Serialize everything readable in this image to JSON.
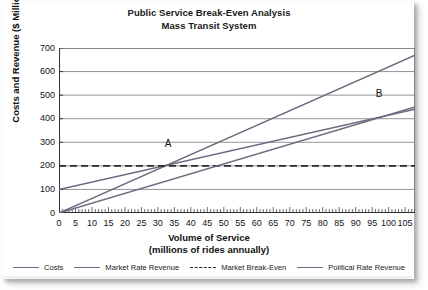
{
  "chart_data": {
    "type": "line",
    "title": "Public Service Break-Even Analysis",
    "subtitle": "Mass Transit System",
    "xlabel": "Volume of Service",
    "xlabel_sub": "(millions of rides annually)",
    "ylabel": "Costs and Revenue ($ Millions)",
    "xlim": [
      0,
      108
    ],
    "ylim": [
      0,
      700
    ],
    "xticks": [
      0,
      5,
      10,
      15,
      20,
      25,
      30,
      35,
      40,
      45,
      50,
      55,
      60,
      65,
      70,
      75,
      80,
      85,
      90,
      95,
      100,
      105
    ],
    "yticks": [
      0,
      100,
      200,
      300,
      400,
      500,
      600,
      700
    ],
    "grid": true,
    "legend_position": "bottom",
    "series": [
      {
        "name": "Costs",
        "style": "solid",
        "color": "#6b6b80",
        "x": [
          0,
          108
        ],
        "y": [
          100,
          440
        ]
      },
      {
        "name": "Market Rate Revenue",
        "style": "solid",
        "color": "#6b6b80",
        "x": [
          0,
          108
        ],
        "y": [
          0,
          670
        ]
      },
      {
        "name": "Market Break-Even",
        "style": "dashed",
        "color": "#2b2b33",
        "x": [
          0,
          108
        ],
        "y": [
          200,
          200
        ]
      },
      {
        "name": "Political Rate Revenue",
        "style": "solid",
        "color": "#6b6b80",
        "x": [
          0,
          108
        ],
        "y": [
          0,
          450
        ]
      }
    ],
    "annotations": [
      {
        "label": "A",
        "x": 33,
        "y": 200,
        "note": "Market rate revenue meets market break-even"
      },
      {
        "label": "B",
        "x": 97,
        "y": 410,
        "note": "Political rate revenue meets costs"
      }
    ]
  },
  "legend": {
    "items": [
      {
        "label": "Costs",
        "style": "solid"
      },
      {
        "label": "Market Rate Revenue",
        "style": "solid"
      },
      {
        "label": "Market Break-Even",
        "style": "dashed"
      },
      {
        "label": "Political Rate Revenue",
        "style": "solid"
      }
    ]
  }
}
